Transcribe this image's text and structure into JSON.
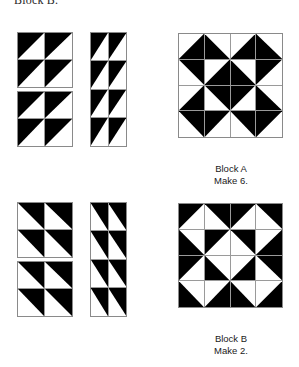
{
  "document": {
    "top_heading": "Block B."
  },
  "palette": {
    "fabric_dark": "#000000",
    "fabric_light": "#ffffff",
    "grid_line": "#8a8a8a",
    "text": "#1a1a1a"
  },
  "sections": [
    {
      "id": "block-a",
      "caption_name": "Block A",
      "caption_quantity": "Make 6.",
      "components": {
        "fourpatch_top": {
          "rows": 2,
          "cols": 2,
          "cells": [
            "tl",
            "tl",
            "tl",
            "tl"
          ]
        },
        "fourpatch_bottom": {
          "rows": 2,
          "cols": 2,
          "cells": [
            "tl",
            "tl",
            "tl",
            "tl"
          ]
        },
        "strip": {
          "rows": 4,
          "cols": 2,
          "cells": [
            "tl",
            "tl",
            "tl",
            "tl",
            "tl",
            "tl",
            "tl",
            "tl"
          ]
        }
      },
      "assembled": {
        "rows": 4,
        "cols": 4,
        "cells": [
          "br",
          "bl",
          "br",
          "bl",
          "tr",
          "br",
          "bl",
          "tl",
          "br",
          "tr",
          "tl",
          "bl",
          "tr",
          "tl",
          "tr",
          "tl"
        ]
      }
    },
    {
      "id": "block-b",
      "caption_name": "Block B",
      "caption_quantity": "Make 2.",
      "components": {
        "fourpatch_top": {
          "rows": 2,
          "cols": 2,
          "cells": [
            "tr",
            "tr",
            "tr",
            "tr"
          ]
        },
        "fourpatch_bottom": {
          "rows": 2,
          "cols": 2,
          "cells": [
            "tr",
            "tr",
            "tr",
            "tr"
          ]
        },
        "strip": {
          "rows": 4,
          "cols": 2,
          "cells": [
            "tr",
            "tr",
            "tr",
            "tr",
            "tr",
            "tr",
            "tr",
            "tr"
          ]
        }
      },
      "assembled": {
        "rows": 4,
        "cols": 4,
        "cells": [
          "tl",
          "tr",
          "tl",
          "tr",
          "bl",
          "tl",
          "tr",
          "br",
          "tl",
          "bl",
          "br",
          "tr",
          "bl",
          "br",
          "bl",
          "br"
        ]
      }
    }
  ],
  "layout": {
    "units": [
      {
        "name": "block-a-fourpatch-top",
        "section": 0,
        "part": "fourpatch_top",
        "x": 17,
        "y": 32,
        "w": 56,
        "h": 56
      },
      {
        "name": "block-a-fourpatch-bottom",
        "section": 0,
        "part": "fourpatch_bottom",
        "x": 17,
        "y": 91,
        "w": 56,
        "h": 56
      },
      {
        "name": "block-a-strip",
        "section": 0,
        "part": "strip",
        "x": 90,
        "y": 32,
        "w": 37,
        "h": 115
      },
      {
        "name": "block-a-assembled",
        "section": 0,
        "part": "assembled",
        "x": 178,
        "y": 33,
        "w": 105,
        "h": 105
      },
      {
        "name": "block-b-fourpatch-top",
        "section": 1,
        "part": "fourpatch_top",
        "x": 17,
        "y": 202,
        "w": 56,
        "h": 56
      },
      {
        "name": "block-b-fourpatch-bottom",
        "section": 1,
        "part": "fourpatch_bottom",
        "x": 17,
        "y": 261,
        "w": 56,
        "h": 56
      },
      {
        "name": "block-b-strip",
        "section": 1,
        "part": "strip",
        "x": 90,
        "y": 202,
        "w": 37,
        "h": 115
      },
      {
        "name": "block-b-assembled",
        "section": 1,
        "part": "assembled",
        "x": 178,
        "y": 203,
        "w": 105,
        "h": 105
      }
    ],
    "captions": [
      {
        "name": "block-a-caption",
        "section": 0,
        "x": 186,
        "y": 163,
        "w": 90
      },
      {
        "name": "block-b-caption",
        "section": 1,
        "x": 186,
        "y": 333,
        "w": 90
      }
    ]
  }
}
